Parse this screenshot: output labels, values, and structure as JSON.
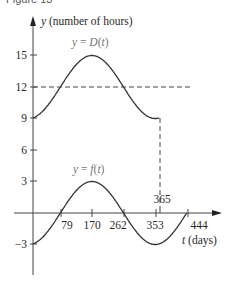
{
  "caption": "Figure 13",
  "chart_data": {
    "type": "line",
    "title": "Figure 13",
    "xlabel": "t (days)",
    "ylabel": "y (number of hours)",
    "x_ticks": [
      79,
      170,
      262,
      353,
      444
    ],
    "x_extra_tick": 365,
    "y_ticks": [
      15,
      12,
      9,
      6,
      3,
      -3
    ],
    "xlim": [
      0,
      444
    ],
    "ylim": [
      -3,
      15
    ],
    "grid": false,
    "series": [
      {
        "name": "y = D(t)",
        "formula": "D(t) = 12 + 3 sin(2π(t−79)/365)",
        "x": [
          0,
          79,
          170,
          262,
          353,
          365
        ],
        "values": [
          9.0,
          12,
          15,
          12,
          9.0,
          9.0
        ]
      },
      {
        "name": "y = f(t)",
        "formula": "f(t) = 3 sin(2π(t−79)/365)",
        "x": [
          0,
          79,
          170,
          262,
          353,
          444
        ],
        "values": [
          -3,
          0,
          3,
          0,
          -3,
          0
        ]
      }
    ],
    "annotations": [
      {
        "type": "hline",
        "y": 12,
        "style": "dashed",
        "label": "midline y = 12"
      },
      {
        "type": "vline",
        "x": 365,
        "style": "dashed",
        "from_y": 0,
        "to_y": 9
      }
    ]
  },
  "labels": {
    "y_axis": "y (number of hours)",
    "x_axis": "t (days)",
    "d_curve": "y = D(t)",
    "f_curve": "y = f(t)",
    "tick_365": "365",
    "x_ticks": [
      "79",
      "170",
      "262",
      "353",
      "444"
    ],
    "y_ticks": [
      "15",
      "12",
      "9",
      "6",
      "3",
      "−3"
    ]
  }
}
